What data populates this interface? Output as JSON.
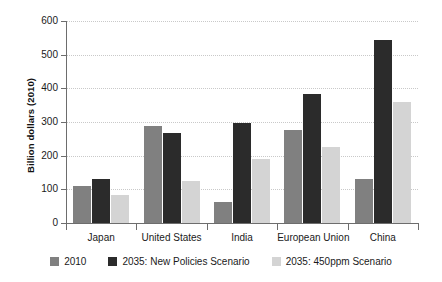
{
  "chart_data": {
    "type": "bar",
    "title": "",
    "xlabel": "",
    "ylabel": "Billion dollars (2010)",
    "ylim": [
      0,
      600
    ],
    "yticks": [
      0,
      100,
      200,
      300,
      400,
      500,
      600
    ],
    "ytick_labels": [
      "0",
      "100",
      "200",
      "300",
      "400",
      "500",
      "600"
    ],
    "grid": true,
    "legend_position": "bottom",
    "categories": [
      "Japan",
      "United States",
      "India",
      "European Union",
      "China"
    ],
    "series": [
      {
        "name": "2010",
        "color": "#808080",
        "values": [
          111,
          287,
          62,
          275,
          130
        ]
      },
      {
        "name": "2035: New Policies Scenario",
        "color": "#2b2b2b",
        "values": [
          131,
          267,
          298,
          383,
          545
        ]
      },
      {
        "name": "2035: 450ppm Scenario",
        "color": "#d4d4d4",
        "values": [
          82,
          126,
          190,
          226,
          360
        ]
      }
    ]
  },
  "axes": {
    "y_title": "Billion dollars (2010)"
  },
  "legend": {
    "items": [
      {
        "label": "2010",
        "color": "#808080"
      },
      {
        "label": "2035: New Policies Scenario",
        "color": "#2b2b2b"
      },
      {
        "label": "2035: 450ppm Scenario",
        "color": "#d4d4d4"
      }
    ]
  },
  "colors": {
    "series_2010": "#808080",
    "series_new_policies": "#2b2b2b",
    "series_450ppm": "#d4d4d4",
    "axis": "#6d6d6d",
    "grid": "#c9c9c9",
    "background": "#ffffff",
    "text": "#1a1a1a"
  }
}
